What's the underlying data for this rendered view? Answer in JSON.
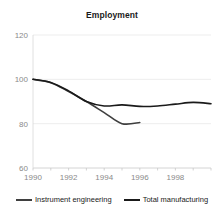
{
  "chart_data": {
    "type": "line",
    "title": "Employment",
    "xlabel": "",
    "ylabel": "",
    "xlim": [
      1990,
      2000
    ],
    "ylim": [
      60,
      120
    ],
    "yticks": [
      60,
      80,
      100,
      120
    ],
    "ytick_labels": [
      "60",
      "80",
      "100",
      "120"
    ],
    "xticks": [
      1990,
      1991,
      1992,
      1993,
      1994,
      1995,
      1996,
      1997,
      1998,
      1999,
      2000
    ],
    "xtick_labels": [
      "1990",
      "",
      "1992",
      "",
      "1994",
      "",
      "1996",
      "",
      "1998",
      "",
      ""
    ],
    "xtick_labeled": [
      1990,
      1992,
      1994,
      1996,
      1998
    ],
    "grid": true,
    "legend_position": "bottom",
    "series": [
      {
        "name": "Instrument engineering",
        "color": "#3f3f3f",
        "x": [
          1990,
          1991,
          1992,
          1993,
          1994,
          1995,
          1996
        ],
        "values": [
          100,
          98.5,
          94.5,
          90,
          85,
          80,
          80.5
        ]
      },
      {
        "name": "Total manufacturing",
        "color": "#1a1a1a",
        "x": [
          1990,
          1991,
          1992,
          1993,
          1994,
          1995,
          1996,
          1997,
          1998,
          1999,
          2000
        ],
        "values": [
          100,
          98.6,
          94.8,
          90,
          88,
          88.5,
          87.8,
          88,
          88.8,
          89.6,
          89
        ]
      }
    ]
  },
  "legend": {
    "entries": [
      {
        "label": "Instrument engineering"
      },
      {
        "label": "Total manufacturing"
      }
    ]
  },
  "colors": {
    "instrument_engineering": "#3f3f3f",
    "total_manufacturing": "#1a1a1a",
    "grid": "#e8e8e8",
    "axis": "#d8d8d8",
    "tick_label": "#8a8a8a",
    "title": "#1a1a1a",
    "background": "#ffffff"
  }
}
